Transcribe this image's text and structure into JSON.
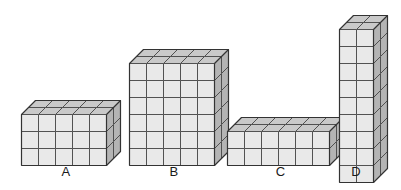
{
  "figure": {
    "background_color": "#ffffff",
    "width": 401,
    "height": 190
  },
  "style": {
    "front_face_color": "#e9e9e9",
    "top_face_color": "#c9c9c9",
    "side_face_color": "#b4b4b4",
    "edge_color": "#4a4a4a",
    "outline_color": "#333333",
    "label_color": "#1a1a1a"
  },
  "chart_data": {
    "type": "bar",
    "title": "",
    "xlabel": "",
    "ylabel": "",
    "categories": [
      "A",
      "B",
      "C",
      "D"
    ],
    "values": [
      30,
      60,
      24,
      36
    ],
    "series": [
      {
        "name": "width (cubes)",
        "values": [
          5,
          5,
          6,
          2
        ]
      },
      {
        "name": "height (cubes)",
        "values": [
          3,
          6,
          2,
          9
        ]
      },
      {
        "name": "depth (cubes)",
        "values": [
          2,
          2,
          2,
          2
        ]
      },
      {
        "name": "total cubes",
        "values": [
          30,
          60,
          24,
          36
        ]
      }
    ],
    "grid": false,
    "legend": "none"
  },
  "blocks": [
    {
      "id": "A",
      "label": "A",
      "cols": 5,
      "rows": 3,
      "depth": 2,
      "cube": 17,
      "dx": 7,
      "dy": 7,
      "left": 20,
      "top": 99,
      "label_left": 20,
      "label_top": 165,
      "label_width": 92
    },
    {
      "id": "B",
      "label": "B",
      "cols": 5,
      "rows": 6,
      "depth": 2,
      "cube": 17,
      "dx": 7,
      "dy": 7,
      "left": 128,
      "top": 48,
      "label_left": 128,
      "label_top": 165,
      "label_width": 92
    },
    {
      "id": "C",
      "label": "C",
      "cols": 6,
      "rows": 2,
      "depth": 2,
      "cube": 17,
      "dx": 7,
      "dy": 7,
      "left": 226,
      "top": 116,
      "label_left": 226,
      "label_top": 165,
      "label_width": 109
    },
    {
      "id": "D",
      "label": "D",
      "cols": 2,
      "rows": 9,
      "depth": 2,
      "cube": 17,
      "dx": 7,
      "dy": 7,
      "left": 338,
      "top": 14,
      "label_left": 327,
      "label_top": 165,
      "label_width": 58
    }
  ]
}
